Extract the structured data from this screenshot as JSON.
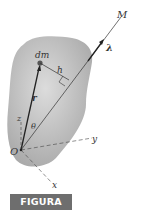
{
  "figure": {
    "caption": "FIGURA B/7",
    "labels": {
      "axis_M": "M",
      "unit_vector": "λ",
      "mass_element": "dm",
      "distance": "h",
      "position_vector": "r",
      "angle": "θ",
      "z_axis": "z",
      "y_axis": "y",
      "x_axis": "x",
      "origin": "O"
    },
    "colors": {
      "body_fill": "#b8b8b8",
      "line": "#333333",
      "badge_bg": "#6e6e6e",
      "badge_text": "#ffffff"
    }
  }
}
